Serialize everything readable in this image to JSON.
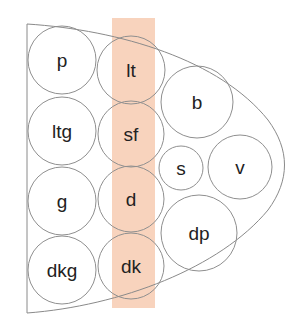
{
  "diagram": {
    "title": "",
    "highlight_color": "#f8d3bd",
    "highlight_label": "highlighted column",
    "nodes": [
      {
        "id": "p",
        "label": "p",
        "column": 1,
        "highlighted": false
      },
      {
        "id": "lt",
        "label": "lt",
        "column": 2,
        "highlighted": true
      },
      {
        "id": "ltg",
        "label": "ltg",
        "column": 1,
        "highlighted": false
      },
      {
        "id": "sf",
        "label": "sf",
        "column": 2,
        "highlighted": true
      },
      {
        "id": "g",
        "label": "g",
        "column": 1,
        "highlighted": false
      },
      {
        "id": "d",
        "label": "d",
        "column": 2,
        "highlighted": true
      },
      {
        "id": "dkg",
        "label": "dkg",
        "column": 1,
        "highlighted": false
      },
      {
        "id": "dk",
        "label": "dk",
        "column": 2,
        "highlighted": true
      },
      {
        "id": "b",
        "label": "b",
        "column": 3,
        "highlighted": false
      },
      {
        "id": "s",
        "label": "s",
        "column": 3,
        "highlighted": false
      },
      {
        "id": "v",
        "label": "v",
        "column": 4,
        "highlighted": false
      },
      {
        "id": "dp",
        "label": "dp",
        "column": 3,
        "highlighted": false
      }
    ]
  }
}
